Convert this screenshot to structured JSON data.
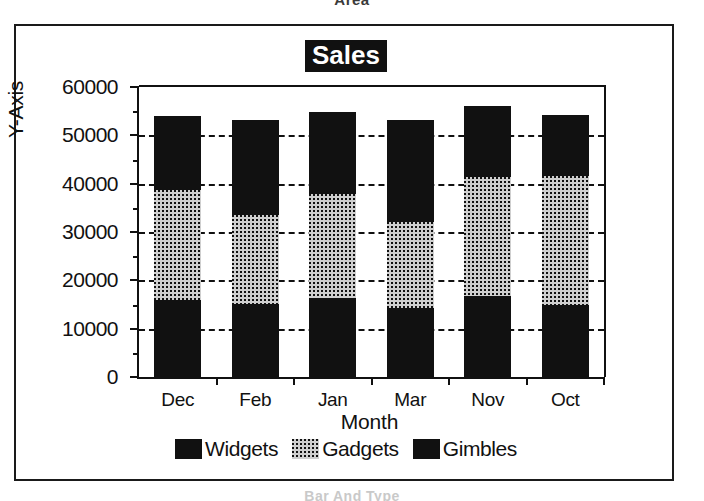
{
  "page": {
    "caption_top": "Area",
    "caption_bottom": "Bar And Type"
  },
  "chart": {
    "title": "Sales",
    "xlabel": "Month",
    "ylabel": "Y-Axis",
    "ytick_labels": [
      "0",
      "10000",
      "20000",
      "30000",
      "40000",
      "50000",
      "60000"
    ],
    "xtick_labels": [
      "Dec",
      "Feb",
      "Jan",
      "Mar",
      "Nov",
      "Oct"
    ],
    "legend": [
      {
        "label": "Widgets",
        "swatch": "solid-black-swatch",
        "color": "#111111"
      },
      {
        "label": "Gadgets",
        "swatch": "dotted-gray-swatch",
        "color": "#cfcfcf"
      },
      {
        "label": "Gimbles",
        "swatch": "solid-black-swatch",
        "color": "#111111"
      }
    ]
  },
  "chart_data": {
    "type": "bar",
    "subtype": "stacked",
    "title": "Sales",
    "xlabel": "Month",
    "ylabel": "Y-Axis",
    "categories": [
      "Dec",
      "Feb",
      "Jan",
      "Mar",
      "Nov",
      "Oct"
    ],
    "series": [
      {
        "name": "Widgets",
        "values": [
          15900,
          15100,
          16300,
          14300,
          16800,
          14900
        ]
      },
      {
        "name": "Gadgets",
        "values": [
          22700,
          18400,
          21500,
          17800,
          24600,
          26700
        ]
      },
      {
        "name": "Gimbles",
        "values": [
          15400,
          19700,
          17000,
          21100,
          14700,
          12600
        ]
      }
    ],
    "totals": [
      54000,
      53200,
      54800,
      53200,
      56100,
      54200
    ],
    "ylim": [
      0,
      60000
    ],
    "yticks": [
      0,
      10000,
      20000,
      30000,
      40000,
      50000,
      60000
    ],
    "yminor_step": 5000,
    "grid": "horizontal-dashed",
    "legend_position": "bottom"
  }
}
